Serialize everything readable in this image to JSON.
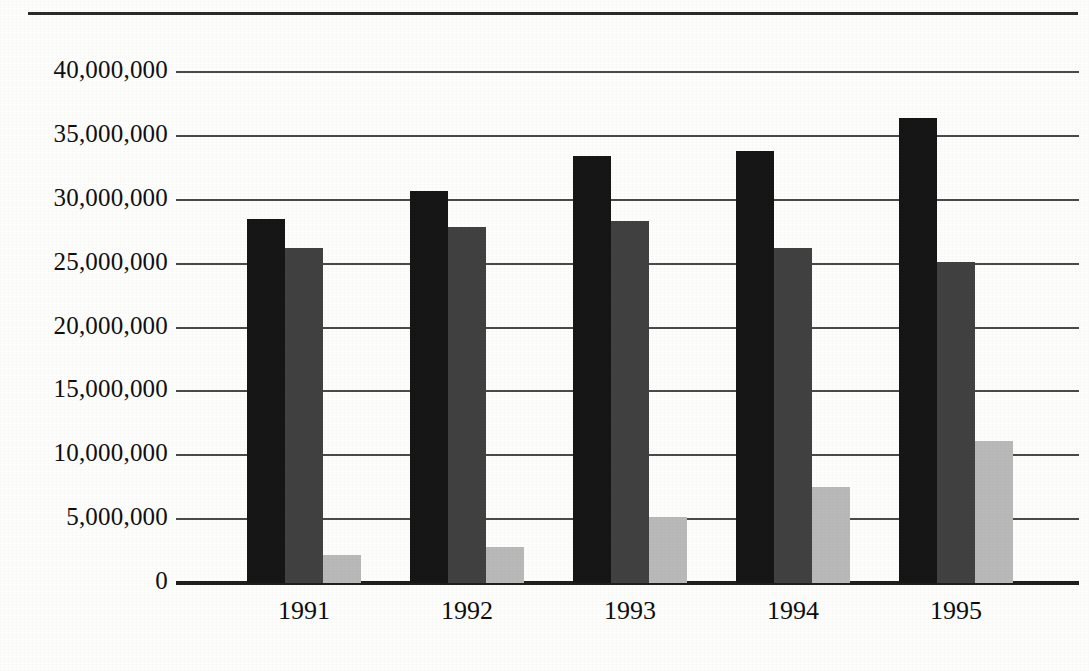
{
  "chart_data": {
    "type": "bar",
    "title": "",
    "subtitle": "",
    "xlabel": "",
    "ylabel": "",
    "categories": [
      "1991",
      "1992",
      "1993",
      "1994",
      "1995"
    ],
    "series": [
      {
        "name": "series-1",
        "color": "#161616",
        "values": [
          28500000,
          30700000,
          33400000,
          33800000,
          36400000
        ]
      },
      {
        "name": "series-2",
        "color": "#414141",
        "values": [
          26200000,
          27900000,
          28300000,
          26200000,
          25100000
        ]
      },
      {
        "name": "series-3",
        "color": "#b9b9b9",
        "values": [
          2200000,
          2800000,
          5200000,
          7500000,
          11100000
        ]
      }
    ],
    "ylim": [
      0,
      40000000
    ],
    "ytick_values": [
      0,
      5000000,
      10000000,
      15000000,
      20000000,
      25000000,
      30000000,
      35000000,
      40000000
    ],
    "ytick_labels": [
      "0",
      "5,000,000",
      "10,000,000",
      "15,000,000",
      "20,000,000",
      "25,000,000",
      "30,000,000",
      "35,000,000",
      "40,000,000"
    ],
    "grid": true,
    "grid_axis": "y",
    "legend": false,
    "legend_position": "none",
    "bar_group_gap": true,
    "annotations": []
  },
  "page": {
    "has_top_rule": true,
    "background_color": "#fdfdfc",
    "axis_color": "#1f1f1f",
    "grid_color": "#4a4a4a",
    "text_color": "#101010"
  }
}
